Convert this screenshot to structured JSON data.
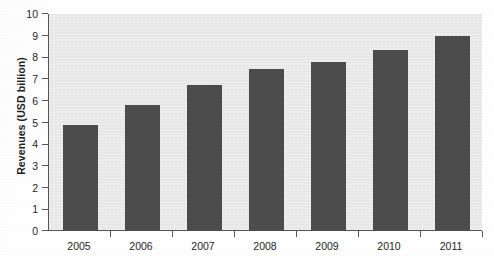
{
  "chart_data": {
    "type": "bar",
    "title": "",
    "subtitle": "",
    "xlabel": "",
    "ylabel": "Revenues (USD billion)",
    "categories": [
      "2005",
      "2006",
      "2007",
      "2008",
      "2009",
      "2010",
      "2011"
    ],
    "values": [
      4.87,
      5.82,
      6.75,
      7.45,
      7.77,
      8.32,
      9.0
    ],
    "series": [
      {
        "name": "Revenues",
        "values": [
          4.87,
          5.82,
          6.75,
          7.45,
          7.77,
          8.32,
          9.0
        ]
      }
    ],
    "ylim": [
      0,
      10
    ],
    "ytick_step": 1,
    "yticks": [
      "0",
      "1",
      "2",
      "3",
      "4",
      "5",
      "6",
      "7",
      "8",
      "9",
      "10"
    ],
    "grid": false,
    "legend": false,
    "legend_position": "none",
    "bar_color": "#4c4c4c",
    "plot_background": "#e9e9e9",
    "page_background": "#ffffff",
    "axis_color": "#555555",
    "text_color": "#1f1f1f",
    "annotations": []
  }
}
